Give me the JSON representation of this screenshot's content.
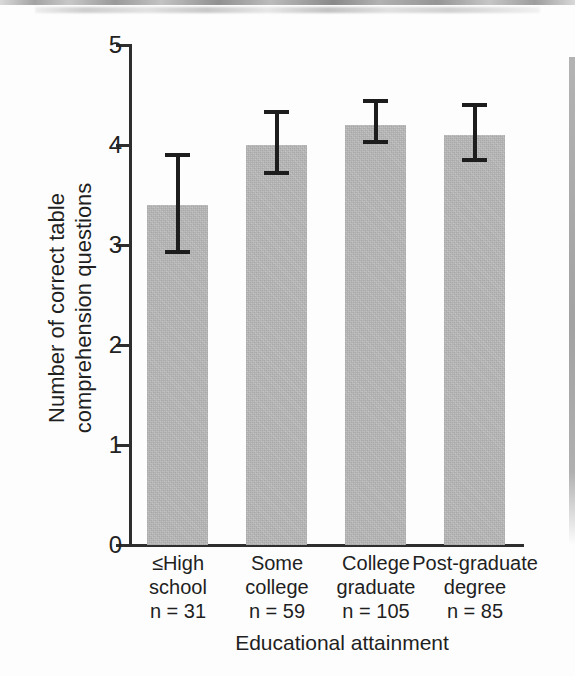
{
  "figure": {
    "background": "#fdfdfd",
    "scan_artifacts": [
      "top-blur-band",
      "right-edge-gutter-shadow"
    ]
  },
  "chart_data": {
    "type": "bar",
    "title": "",
    "xlabel": "Educational attainment",
    "ylabel_lines": [
      "Number of correct table",
      "comprehension questions"
    ],
    "categories": [
      {
        "label_lines": [
          "≤High",
          "school"
        ],
        "n_label": "n = 31",
        "n": 31
      },
      {
        "label_lines": [
          "Some",
          "college"
        ],
        "n_label": "n = 59",
        "n": 59
      },
      {
        "label_lines": [
          "College",
          "graduate"
        ],
        "n_label": "n = 105",
        "n": 105
      },
      {
        "label_lines": [
          "Post-graduate",
          "degree"
        ],
        "n_label": "n = 85",
        "n": 85
      }
    ],
    "values": [
      3.4,
      4.0,
      4.2,
      4.1
    ],
    "error_bars": {
      "low": [
        2.93,
        3.72,
        4.03,
        3.85
      ],
      "high": [
        3.9,
        4.33,
        4.44,
        4.4
      ]
    },
    "ylim": [
      0,
      5
    ],
    "yticks": [
      0,
      1,
      2,
      3,
      4,
      5
    ],
    "grid": false,
    "legend": null,
    "bar_color": "#bcbcbc",
    "error_color": "#1d1d1d",
    "axis_color": "#2e2e2e",
    "text_color": "#1f1f1f"
  }
}
